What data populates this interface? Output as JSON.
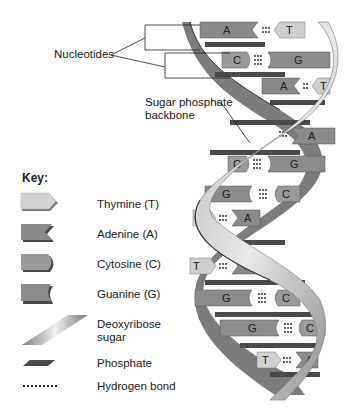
{
  "diagram": {
    "callouts": {
      "nucleotides": "Nucleotides",
      "backbone_line1": "Sugar phosphate",
      "backbone_line2": "backbone"
    },
    "base_pairs": [
      {
        "left": "A",
        "right": "T",
        "bonds": 2
      },
      {
        "left": "C",
        "right": "G",
        "bonds": 3
      },
      {
        "left": "A",
        "right": "T",
        "bonds": 2
      },
      {
        "left": "",
        "right": "A",
        "bonds": 2
      },
      {
        "left": "C",
        "right": "G",
        "bonds": 3
      },
      {
        "left": "G",
        "right": "C",
        "bonds": 3
      },
      {
        "left": "T",
        "right": "A",
        "bonds": 2
      },
      {
        "left": "T",
        "right": "A",
        "bonds": 2
      },
      {
        "left": "G",
        "right": "C",
        "bonds": 3
      },
      {
        "left": "G",
        "right": "C",
        "bonds": 3
      },
      {
        "left": "T",
        "right": "A",
        "bonds": 2
      }
    ]
  },
  "key": {
    "title": "Key:",
    "items": [
      {
        "icon": "thymine-icon",
        "label": "Thymine (T)"
      },
      {
        "icon": "adenine-icon",
        "label": "Adenine (A)"
      },
      {
        "icon": "cytosine-icon",
        "label": "Cytosine (C)"
      },
      {
        "icon": "guanine-icon",
        "label": "Guanine (G)"
      },
      {
        "icon": "deoxyribose-sugar-icon",
        "label_line1": "Deoxyribose",
        "label_line2": "sugar"
      },
      {
        "icon": "phosphate-icon",
        "label": "Phosphate"
      },
      {
        "icon": "hydrogen-bond-icon",
        "label": "Hydrogen bond"
      }
    ]
  },
  "colors": {
    "thymine": "#cfcfcf",
    "adenine": "#8a8a8a",
    "cytosine": "#9a9a9a",
    "guanine": "#8c8c8c",
    "backbone_light": "#d8d8d8",
    "backbone_dark": "#5a5a5a",
    "phosphate": "#4a4a4a"
  }
}
